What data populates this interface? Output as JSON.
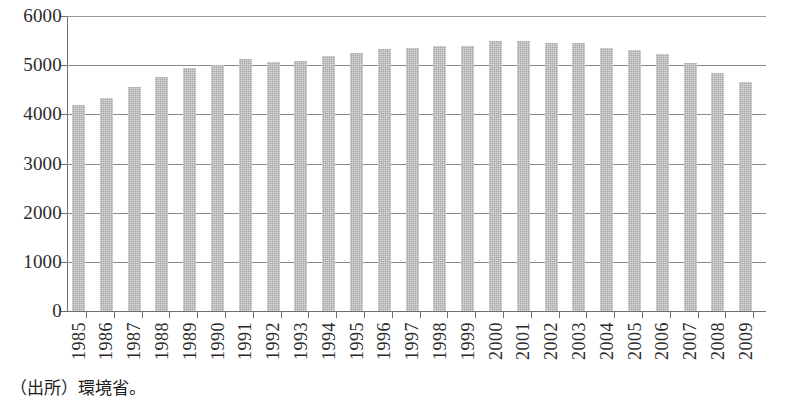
{
  "chart_data": {
    "type": "bar",
    "title": "",
    "subtitle": "",
    "xlabel": "",
    "ylabel": "",
    "ylim": [
      0,
      6000
    ],
    "ytick_labels": [
      "6000",
      "5000",
      "4000",
      "3000",
      "2000",
      "1000",
      "0"
    ],
    "ytick_values": [
      6000,
      5000,
      4000,
      3000,
      2000,
      1000,
      0
    ],
    "grid": true,
    "legend": null,
    "legend_position": "none",
    "bar_color": "#a6a6a6",
    "categories": [
      "1985",
      "1986",
      "1987",
      "1988",
      "1989",
      "1990",
      "1991",
      "1992",
      "1993",
      "1994",
      "1995",
      "1996",
      "1997",
      "1998",
      "1999",
      "2000",
      "2001",
      "2002",
      "2003",
      "2004",
      "2005",
      "2006",
      "2007",
      "2008",
      "2009"
    ],
    "values": [
      4200,
      4330,
      4550,
      4750,
      4940,
      5010,
      5120,
      5070,
      5090,
      5180,
      5240,
      5320,
      5340,
      5400,
      5400,
      5500,
      5490,
      5450,
      5450,
      5350,
      5300,
      5230,
      5050,
      4850,
      4650
    ]
  },
  "footer": {
    "source_note": "（出所）環境省。"
  }
}
